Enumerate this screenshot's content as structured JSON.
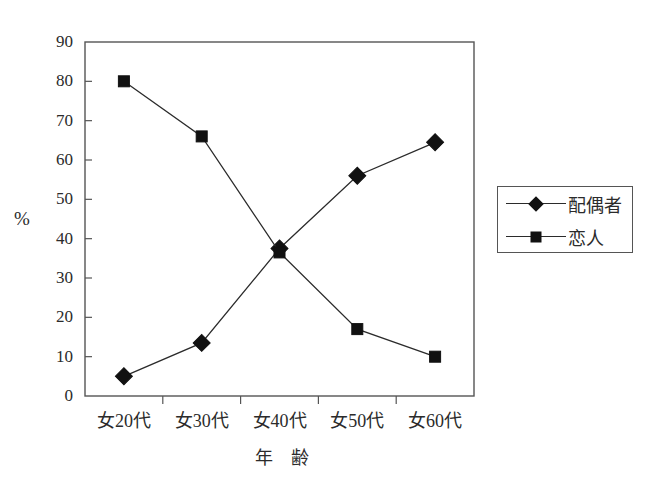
{
  "chart_data": {
    "type": "line",
    "title": "",
    "subtitle": "",
    "xlabel": "年　齢",
    "ylabel": "%",
    "categories": [
      "女20代",
      "女30代",
      "女40代",
      "女50代",
      "女60代"
    ],
    "ylim": [
      0,
      90
    ],
    "yticks": [
      0,
      10,
      20,
      30,
      40,
      50,
      60,
      70,
      80,
      90
    ],
    "ytick_labels": [
      "0",
      "10",
      "20",
      "30",
      "40",
      "50",
      "60",
      "70",
      "80",
      "90"
    ],
    "grid": false,
    "legend_position": "right",
    "series": [
      {
        "name": "配偶者",
        "marker": "diamond",
        "color": "#111111",
        "values": [
          5,
          13.5,
          37.5,
          56,
          64.5
        ]
      },
      {
        "name": "恋人",
        "marker": "square",
        "color": "#111111",
        "values": [
          80,
          66,
          36.5,
          17,
          10
        ]
      }
    ]
  },
  "axes": {
    "y_axis_label": "%",
    "x_axis_title": "年　齢"
  },
  "legend": {
    "entries": [
      {
        "label": "配偶者",
        "marker": "diamond"
      },
      {
        "label": "恋人",
        "marker": "square"
      }
    ]
  },
  "colors": {
    "line": "#2b2b2b",
    "marker": "#111111",
    "axis": "#555555",
    "text": "#2b2b2b",
    "background": "#ffffff"
  }
}
